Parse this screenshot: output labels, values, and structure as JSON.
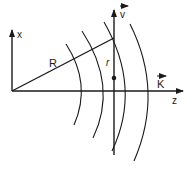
{
  "diagram": {
    "labels": {
      "x_axis": "x",
      "z_axis": "z",
      "radius": "R",
      "distance": "r",
      "velocity": "v",
      "wave_vector": "K"
    },
    "colors": {
      "line": "#1a1a1a",
      "background": "#ffffff"
    },
    "elements": [
      "x-axis arrow",
      "z-axis arrow",
      "radius line R from origin",
      "vertical velocity line v",
      "point on velocity line",
      "four circular wavefront arcs"
    ]
  }
}
